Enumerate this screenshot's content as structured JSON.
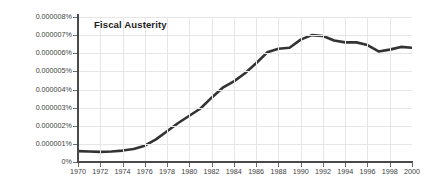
{
  "chart_data": {
    "type": "line",
    "title": "Fiscal Austerity",
    "xlabel": "",
    "ylabel": "",
    "xlim": [
      1970,
      2000
    ],
    "ylim": [
      0,
      8e-06
    ],
    "grid": true,
    "legend": null,
    "line_color": "#333333",
    "x_tick_labels": [
      "1970",
      "1972",
      "1974",
      "1976",
      "1978",
      "1980",
      "1982",
      "1984",
      "1986",
      "1988",
      "1990",
      "1992",
      "1994",
      "1996",
      "1998",
      "2000"
    ],
    "x_ticks": [
      1970,
      1972,
      1974,
      1976,
      1978,
      1980,
      1982,
      1984,
      1986,
      1988,
      1990,
      1992,
      1994,
      1996,
      1998,
      2000
    ],
    "y_tick_labels": [
      "0%",
      "0.000001%",
      "0.000002%",
      "0.000003%",
      "0.000004%",
      "0.000005%",
      "0.000006%",
      "0.000007%",
      "0.000008%"
    ],
    "y_ticks": [
      0,
      1e-06,
      2e-06,
      3e-06,
      4e-06,
      5e-06,
      6e-06,
      7e-06,
      8e-06
    ],
    "series": [
      {
        "name": "Fiscal Austerity",
        "x": [
          1970,
          1971,
          1972,
          1973,
          1974,
          1975,
          1976,
          1977,
          1978,
          1979,
          1980,
          1981,
          1982,
          1983,
          1984,
          1985,
          1986,
          1987,
          1988,
          1989,
          1990,
          1991,
          1992,
          1993,
          1994,
          1995,
          1996,
          1997,
          1998,
          1999,
          2000
        ],
        "values": [
          6e-07,
          5.8e-07,
          5.6e-07,
          5.8e-07,
          6.3e-07,
          7.2e-07,
          9e-07,
          1.25e-06,
          1.7e-06,
          2.15e-06,
          2.55e-06,
          2.95e-06,
          3.55e-06,
          4.1e-06,
          4.45e-06,
          4.9e-06,
          5.45e-06,
          6.05e-06,
          6.25e-06,
          6.3e-06,
          6.75e-06,
          7e-06,
          6.95e-06,
          6.7e-06,
          6.6e-06,
          6.6e-06,
          6.45e-06,
          6.1e-06,
          6.2e-06,
          6.35e-06,
          6.3e-06
        ]
      }
    ]
  }
}
